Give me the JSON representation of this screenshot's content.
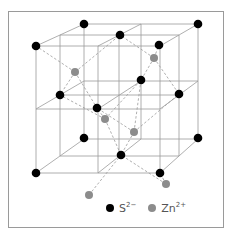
{
  "figure": {
    "colors": {
      "sulfide": "#000000",
      "zinc": "#8c8c8c",
      "lattice_line": "#9a9a9a",
      "bond_line": "#9a9a9a",
      "frame": "#9a9a9a"
    },
    "lattice_lines": [
      [
        36,
        46,
        160,
        46
      ],
      [
        36,
        109,
        160,
        109
      ],
      [
        36,
        173,
        160,
        173
      ],
      [
        36,
        46,
        36,
        173
      ],
      [
        98,
        46,
        98,
        173
      ],
      [
        160,
        46,
        160,
        173
      ],
      [
        84,
        24,
        198,
        24
      ],
      [
        84,
        81,
        198,
        81
      ],
      [
        84,
        139,
        198,
        139
      ],
      [
        84,
        24,
        84,
        139
      ],
      [
        141,
        24,
        141,
        139
      ],
      [
        198,
        24,
        198,
        139
      ],
      [
        60,
        35,
        179,
        35
      ],
      [
        60,
        95,
        179,
        95
      ],
      [
        60,
        156,
        179,
        156
      ],
      [
        60,
        35,
        60,
        156
      ],
      [
        119,
        35,
        119,
        156
      ],
      [
        179,
        35,
        179,
        156
      ],
      [
        36,
        46,
        84,
        24
      ],
      [
        98,
        46,
        141,
        24
      ],
      [
        160,
        46,
        198,
        24
      ],
      [
        36,
        109,
        84,
        81
      ],
      [
        98,
        109,
        141,
        81
      ],
      [
        160,
        109,
        198,
        81
      ],
      [
        36,
        173,
        84,
        139
      ],
      [
        98,
        173,
        141,
        139
      ],
      [
        160,
        173,
        198,
        139
      ]
    ],
    "bonds": [
      [
        75,
        72,
        36,
        46
      ],
      [
        75,
        72,
        120,
        35
      ],
      [
        75,
        72,
        60,
        95
      ],
      [
        75,
        72,
        97,
        108
      ],
      [
        154,
        58,
        120,
        35
      ],
      [
        154,
        58,
        159,
        45
      ],
      [
        154,
        58,
        141,
        80
      ],
      [
        154,
        58,
        179,
        94
      ],
      [
        105,
        119,
        97,
        108
      ],
      [
        105,
        119,
        60,
        95
      ],
      [
        105,
        119,
        121,
        155
      ],
      [
        105,
        119,
        141,
        80
      ],
      [
        134,
        132,
        97,
        108
      ],
      [
        134,
        132,
        179,
        94
      ],
      [
        134,
        132,
        121,
        155
      ],
      [
        134,
        132,
        141,
        80
      ],
      [
        166,
        184,
        121,
        155
      ],
      [
        166,
        184,
        160,
        173
      ],
      [
        89,
        195,
        121,
        155
      ]
    ],
    "atoms": {
      "sulfide": [
        [
          84,
          24
        ],
        [
          198,
          24
        ],
        [
          120,
          35
        ],
        [
          159,
          45
        ],
        [
          36,
          46
        ],
        [
          141,
          80
        ],
        [
          60,
          95
        ],
        [
          179,
          94
        ],
        [
          97,
          108
        ],
        [
          84,
          138
        ],
        [
          198,
          138
        ],
        [
          121,
          155
        ],
        [
          36,
          173
        ],
        [
          160,
          173
        ]
      ],
      "zinc": [
        [
          75,
          72
        ],
        [
          154,
          58
        ],
        [
          105,
          119
        ],
        [
          134,
          132
        ],
        [
          166,
          184
        ],
        [
          89,
          195
        ]
      ]
    },
    "atom_radius": {
      "sulfide": 4.3,
      "zinc": 4.0
    },
    "legend": [
      {
        "name": "sulfide",
        "symbol": "S",
        "charge": "2−",
        "color": "#000000"
      },
      {
        "name": "zinc",
        "symbol": "Zn",
        "charge": "2+",
        "color": "#8c8c8c"
      }
    ]
  }
}
